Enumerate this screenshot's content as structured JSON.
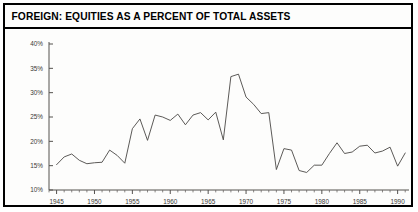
{
  "chart_panel": {
    "title": "FOREIGN: EQUITIES AS A PERCENT OF TOTAL ASSETS",
    "border_color": "#000000",
    "background_color": "#fdfdfc",
    "line_color": "#4a4745",
    "axis_color": "#55524f"
  },
  "chart_data": {
    "type": "line",
    "title": "FOREIGN: EQUITIES AS A PERCENT OF TOTAL ASSETS",
    "xlabel": "",
    "ylabel": "",
    "grid": false,
    "legend": null,
    "xlim": [
      1944,
      1991.5
    ],
    "ylim": [
      10,
      40
    ],
    "y_tick_labels": [
      "10%",
      "15%",
      "20%",
      "25%",
      "30%",
      "35%",
      "40%"
    ],
    "y_tick_values": [
      10,
      15,
      20,
      25,
      30,
      35,
      40
    ],
    "x_tick_labels": [
      "1945",
      "1950",
      "1955",
      "1960",
      "1965",
      "1970",
      "1975",
      "1980",
      "1985",
      "1990"
    ],
    "x_tick_values": [
      1945,
      1950,
      1955,
      1960,
      1965,
      1970,
      1975,
      1980,
      1985,
      1990
    ],
    "x_minor_tick_interval": 1,
    "series": [
      {
        "name": "Foreign equities as percent of total assets",
        "x": [
          1945,
          1946,
          1947,
          1948,
          1949,
          1950,
          1951,
          1952,
          1953,
          1954,
          1955,
          1956,
          1957,
          1958,
          1959,
          1960,
          1961,
          1962,
          1963,
          1964,
          1965,
          1966,
          1967,
          1968,
          1969,
          1970,
          1971,
          1972,
          1973,
          1974,
          1975,
          1976,
          1977,
          1978,
          1979,
          1980,
          1981,
          1982,
          1983,
          1984,
          1985,
          1986,
          1987,
          1988,
          1989,
          1990,
          1991
        ],
        "values": [
          15.2,
          16.8,
          17.4,
          16.1,
          15.4,
          15.6,
          15.7,
          18.2,
          17.1,
          15.5,
          22.6,
          24.6,
          20.2,
          25.4,
          25.0,
          24.3,
          25.6,
          23.4,
          25.4,
          25.9,
          24.4,
          26.0,
          20.3,
          33.3,
          33.8,
          29.1,
          27.6,
          25.7,
          25.9,
          14.2,
          18.5,
          18.2,
          14.0,
          13.6,
          15.1,
          15.1,
          17.5,
          19.7,
          17.5,
          17.8,
          19.0,
          19.2,
          17.6,
          18.0,
          18.8,
          14.9,
          17.6
        ]
      }
    ]
  }
}
